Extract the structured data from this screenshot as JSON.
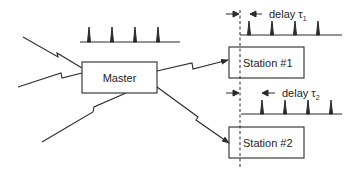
{
  "diagram": {
    "master": {
      "label": "Master"
    },
    "stations": [
      {
        "label": "Station #1",
        "delay_label": "delay τ",
        "delay_subscript": "1"
      },
      {
        "label": "Station #2",
        "delay_label": "delay τ",
        "delay_subscript": "2"
      }
    ],
    "pulse_counts": {
      "master": 4,
      "station_1": 4,
      "station_2": 4
    },
    "colors": {
      "stroke": "#2a2a2a",
      "background": "#ffffff"
    }
  }
}
